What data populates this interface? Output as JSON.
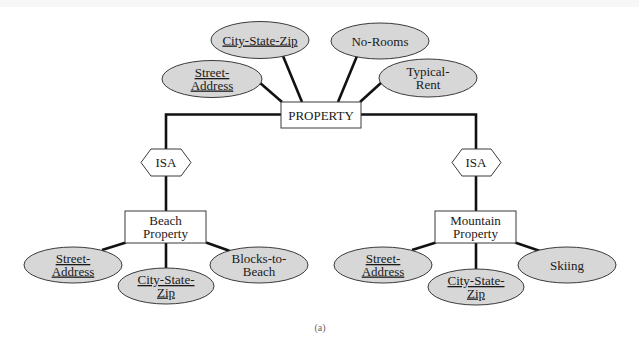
{
  "figure": {
    "caption": "(a)"
  },
  "entities": {
    "property": {
      "label": "PROPERTY"
    },
    "beach": {
      "lines": [
        "Beach",
        "Property"
      ]
    },
    "mountain": {
      "lines": [
        "Mountain",
        "Property"
      ]
    }
  },
  "relationships": {
    "isa_left": {
      "label": "ISA"
    },
    "isa_right": {
      "label": "ISA"
    }
  },
  "attributes": {
    "property": [
      {
        "lines": [
          "City-State-Zip"
        ],
        "key": true
      },
      {
        "lines": [
          "No-Rooms"
        ],
        "key": false
      },
      {
        "lines": [
          "Street-",
          "Address"
        ],
        "key": true
      },
      {
        "lines": [
          "Typical-",
          "Rent"
        ],
        "key": false
      }
    ],
    "beach": [
      {
        "lines": [
          "Street-",
          "Address"
        ],
        "key": true
      },
      {
        "lines": [
          "City-State-",
          "Zip"
        ],
        "key": true
      },
      {
        "lines": [
          "Blocks-to-",
          "Beach"
        ],
        "key": false
      }
    ],
    "mountain": [
      {
        "lines": [
          "Street-",
          "Address"
        ],
        "key": true
      },
      {
        "lines": [
          "City-State-",
          "Zip"
        ],
        "key": true
      },
      {
        "lines": [
          "Skiing"
        ],
        "key": false
      }
    ]
  },
  "colors": {
    "attribute_fill": "#d7d7d7",
    "line": "#111111",
    "border": "#3a3a3a",
    "background": "#ffffff"
  }
}
